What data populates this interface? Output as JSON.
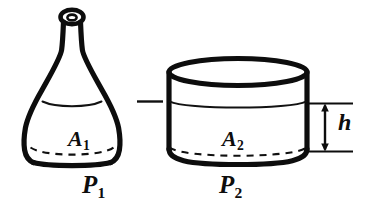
{
  "figure": {
    "background_color": "#ffffff",
    "ink_color": "#0d0d0d",
    "labels": {
      "area_left_symbol": "A",
      "area_left_subscript": "1",
      "area_right_symbol": "A",
      "area_right_subscript": "2",
      "pressure_left_symbol": "P",
      "pressure_left_subscript": "1",
      "pressure_right_symbol": "P",
      "pressure_right_subscript": "2",
      "height_symbol": "h"
    },
    "left_vessel": {
      "name": "conical-flask",
      "description": "Erlenmeyer-style flask with narrow necked top and flared base",
      "liquid_level_label": "free surface",
      "base_area_label": "A",
      "base_area_subscript": "1",
      "pressure_label": "P",
      "pressure_subscript": "1"
    },
    "right_vessel": {
      "name": "cylindrical-beaker",
      "description": "Wide open cylinder with elliptical rim",
      "liquid_level_label": "free surface",
      "base_area_label": "A",
      "base_area_subscript": "2",
      "pressure_label": "P",
      "pressure_subscript": "2"
    },
    "dimension": {
      "name": "liquid-depth",
      "symbol": "h",
      "description": "Vertical depth from free surface to base of the cylindrical vessel",
      "arrow_style": "double-headed"
    },
    "level_connector": {
      "name": "equal-level-dash",
      "description": "Short horizontal dash indicating the two free surfaces lie at the same height"
    }
  }
}
